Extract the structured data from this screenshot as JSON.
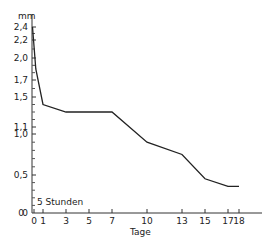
{
  "chart_data": {
    "type": "line",
    "title": "",
    "xlabel": "Tage",
    "ylabel": "mm",
    "annotation": "5 Stunden",
    "x_ticks": [
      0,
      1,
      3,
      5,
      7,
      10,
      13,
      15,
      17,
      18
    ],
    "y_ticks": [
      {
        "label": "2,4",
        "value": 2.4
      },
      {
        "label": "2,2",
        "value": 2.2
      },
      {
        "label": "2,0",
        "value": 2.0
      },
      {
        "label": "1,7",
        "value": 1.7
      },
      {
        "label": "1,5",
        "value": 1.5
      },
      {
        "label": "1,1",
        "value": 1.1
      },
      {
        "label": "1,0",
        "value": 1.0
      },
      {
        "label": "0,5",
        "value": 0.5
      },
      {
        "label": "0",
        "value": 0
      }
    ],
    "series": [
      {
        "name": "Messwerte",
        "points": [
          {
            "x": 0,
            "y": 2.4
          },
          {
            "x": 0.2,
            "y": 1.85
          },
          {
            "x": 1,
            "y": 1.4
          },
          {
            "x": 3,
            "y": 1.3
          },
          {
            "x": 7,
            "y": 1.3
          },
          {
            "x": 10,
            "y": 0.9
          },
          {
            "x": 13,
            "y": 0.75
          },
          {
            "x": 15,
            "y": 0.45
          },
          {
            "x": 17,
            "y": 0.35
          },
          {
            "x": 18,
            "y": 0.35
          }
        ]
      }
    ],
    "grid": false
  },
  "axis": {
    "y_unit": "mm",
    "x_title": "Tage",
    "zero_label": "0",
    "hours_label": "5 Stunden"
  }
}
